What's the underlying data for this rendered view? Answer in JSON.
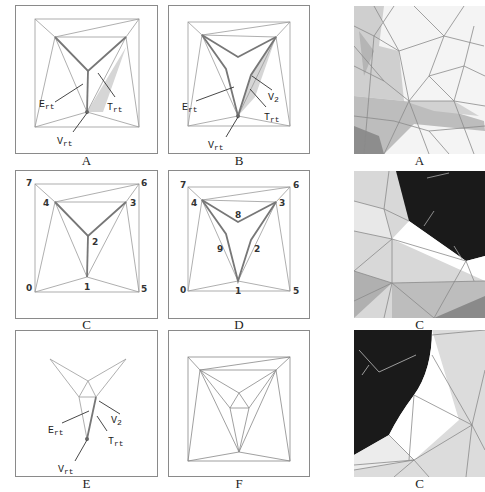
{
  "figure": {
    "panels": [
      {
        "id": "A",
        "caption": "A",
        "labels": {
          "edge": "E",
          "edge_sub": "rt",
          "tri": "T",
          "tri_sub": "rt",
          "vert": "V",
          "vert_sub": "rt"
        }
      },
      {
        "id": "B",
        "caption": "B",
        "labels": {
          "edge": "E",
          "edge_sub": "rt",
          "v2": "V",
          "v2_sub": "2",
          "tri": "T",
          "tri_sub": "rt",
          "vert": "V",
          "vert_sub": "rt"
        }
      },
      {
        "id": "A-render",
        "caption": "A"
      },
      {
        "id": "C",
        "caption": "C",
        "vertex_numbers": [
          "0",
          "1",
          "2",
          "3",
          "4",
          "5",
          "6",
          "7"
        ]
      },
      {
        "id": "D",
        "caption": "D",
        "vertex_numbers": [
          "0",
          "1",
          "2",
          "3",
          "4",
          "5",
          "6",
          "7",
          "8",
          "9"
        ]
      },
      {
        "id": "C-render",
        "caption": "C"
      },
      {
        "id": "E",
        "caption": "E",
        "labels": {
          "edge": "E",
          "edge_sub": "rt",
          "v2": "V",
          "v2_sub": "2",
          "tri": "T",
          "tri_sub": "rt",
          "vert": "V",
          "vert_sub": "rt"
        }
      },
      {
        "id": "F",
        "caption": "F"
      },
      {
        "id": "C-render-2",
        "caption": "C"
      }
    ]
  },
  "colors": {
    "frame": "#8a8a8a",
    "thin": "#9a9a9a",
    "thick": "#777777",
    "shade": "#d6d6d6",
    "dark": "#1a1a1a"
  }
}
